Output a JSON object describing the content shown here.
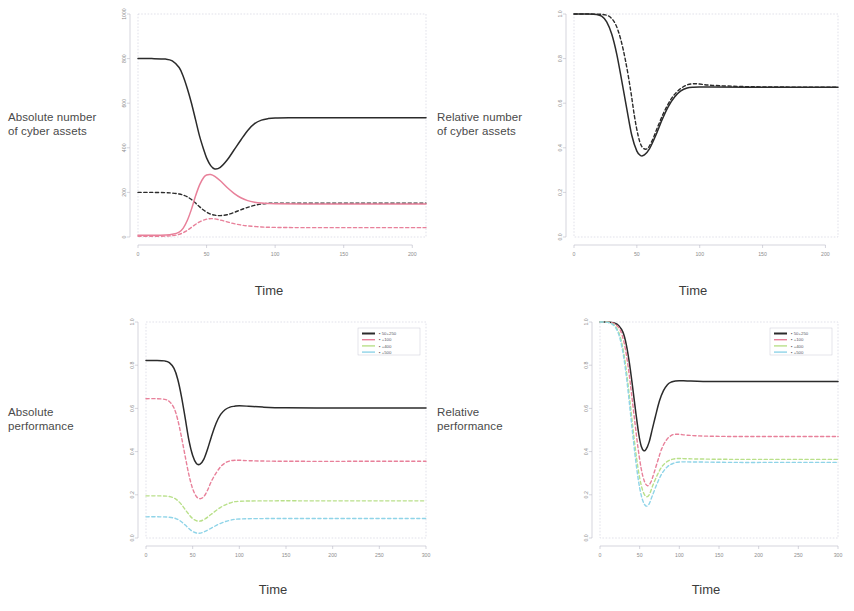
{
  "figure": {
    "row_labels": [
      "Absolute number\nof cyber assets",
      "Relative number\nof cyber assets",
      "Absolute\nperformance",
      "Relative\nperformance"
    ],
    "xlabel": "Time"
  },
  "colors": {
    "black": "#2b2b2b",
    "red": "#e8809a",
    "green": "#b9e08a",
    "cyan": "#8fd4e8",
    "axis": "#b8b8c6",
    "tick_text": "#8d8d8d",
    "label_text": "#4a4a4a"
  },
  "legend": {
    "entries": [
      {
        "label": "50+250",
        "color": "#2b2b2b"
      },
      {
        "label": "+100",
        "color": "#e8809a"
      },
      {
        "label": "+400",
        "color": "#b9e08a"
      },
      {
        "label": "+500",
        "color": "#8fd4e8"
      }
    ]
  },
  "chart_data": [
    {
      "id": "absolute-number",
      "type": "line",
      "title": "Absolute number of cyber assets",
      "xlabel": "Time",
      "ylabel": "",
      "xlim": [
        0,
        210
      ],
      "ylim": [
        0,
        1000
      ],
      "xticks": [
        0,
        50,
        100,
        150,
        200
      ],
      "yticks": [
        0,
        200,
        400,
        600,
        800,
        1000
      ],
      "grid": false,
      "series": [
        {
          "name": "50+250 total",
          "color": "#2b2b2b",
          "style": "solid",
          "x": [
            0,
            10,
            20,
            25,
            30,
            33,
            36,
            39,
            42,
            45,
            48,
            50,
            53,
            56,
            60,
            65,
            70,
            75,
            80,
            85,
            90,
            95,
            100,
            110,
            130,
            160,
            200,
            210
          ],
          "y": [
            800,
            800,
            798,
            790,
            760,
            720,
            665,
            600,
            525,
            450,
            390,
            355,
            320,
            305,
            312,
            345,
            390,
            435,
            478,
            508,
            524,
            531,
            534,
            535,
            535,
            535,
            535,
            535
          ]
        },
        {
          "name": "50+250 susceptible",
          "color": "#2b2b2b",
          "style": "dashed",
          "x": [
            0,
            10,
            20,
            25,
            30,
            33,
            36,
            39,
            42,
            45,
            48,
            52,
            56,
            60,
            65,
            70,
            75,
            80,
            85,
            90,
            95,
            100,
            120,
            160,
            200,
            210
          ],
          "y": [
            200,
            200,
            199,
            197,
            193,
            188,
            180,
            168,
            152,
            135,
            120,
            105,
            98,
            96,
            100,
            110,
            122,
            133,
            142,
            148,
            151,
            152,
            152,
            152,
            152,
            152
          ]
        },
        {
          "name": "+100 infected",
          "color": "#e8809a",
          "style": "solid",
          "x": [
            0,
            10,
            20,
            25,
            30,
            33,
            36,
            39,
            42,
            45,
            48,
            50,
            53,
            56,
            60,
            65,
            70,
            75,
            80,
            85,
            90,
            95,
            100,
            120,
            160,
            200,
            210
          ],
          "y": [
            8,
            8,
            9,
            12,
            22,
            40,
            75,
            125,
            185,
            235,
            268,
            278,
            280,
            272,
            252,
            222,
            196,
            176,
            163,
            156,
            152,
            150,
            149,
            148,
            148,
            148,
            148
          ]
        },
        {
          "name": "+100 recovered",
          "color": "#e8809a",
          "style": "dashed",
          "x": [
            0,
            10,
            20,
            25,
            30,
            35,
            40,
            45,
            50,
            55,
            60,
            65,
            70,
            75,
            80,
            90,
            100,
            120,
            160,
            200,
            210
          ],
          "y": [
            3,
            3,
            4,
            6,
            12,
            26,
            48,
            68,
            80,
            82,
            76,
            68,
            60,
            54,
            50,
            45,
            43,
            42,
            42,
            42,
            42
          ]
        }
      ]
    },
    {
      "id": "relative-number",
      "type": "line",
      "title": "Relative number of cyber assets",
      "xlabel": "Time",
      "ylabel": "",
      "xlim": [
        0,
        210
      ],
      "ylim": [
        0,
        1.0
      ],
      "xticks": [
        0,
        50,
        100,
        150,
        200
      ],
      "yticks": [
        0.0,
        0.2,
        0.4,
        0.6,
        0.8,
        1.0
      ],
      "grid": false,
      "series": [
        {
          "name": "50+250",
          "color": "#2b2b2b",
          "style": "solid",
          "x": [
            0,
            10,
            18,
            22,
            26,
            30,
            34,
            38,
            42,
            46,
            50,
            53,
            56,
            60,
            65,
            70,
            75,
            80,
            85,
            90,
            95,
            100,
            110,
            140,
            180,
            210
          ],
          "y": [
            1.0,
            1.0,
            0.998,
            0.99,
            0.965,
            0.91,
            0.82,
            0.7,
            0.575,
            0.455,
            0.385,
            0.365,
            0.368,
            0.395,
            0.455,
            0.525,
            0.585,
            0.628,
            0.655,
            0.668,
            0.672,
            0.673,
            0.673,
            0.672,
            0.672,
            0.672
          ]
        },
        {
          "name": "+100",
          "color": "#2b2b2b",
          "style": "dashed",
          "x": [
            0,
            10,
            20,
            25,
            29,
            33,
            37,
            41,
            45,
            48,
            51,
            54,
            58,
            62,
            67,
            72,
            78,
            84,
            90,
            95,
            100,
            110,
            140,
            180,
            210
          ],
          "y": [
            1.0,
            1.0,
            0.999,
            0.996,
            0.985,
            0.955,
            0.89,
            0.79,
            0.66,
            0.545,
            0.455,
            0.405,
            0.395,
            0.43,
            0.5,
            0.565,
            0.625,
            0.662,
            0.682,
            0.687,
            0.686,
            0.68,
            0.674,
            0.672,
            0.672
          ]
        }
      ]
    },
    {
      "id": "absolute-performance",
      "type": "line",
      "title": "Absolute performance",
      "xlabel": "Time",
      "ylabel": "",
      "xlim": [
        0,
        300
      ],
      "ylim": [
        0,
        1.0
      ],
      "xticks": [
        0,
        50,
        100,
        150,
        200,
        250,
        300
      ],
      "yticks": [
        0.0,
        0.2,
        0.4,
        0.6,
        0.8,
        1.0
      ],
      "grid": false,
      "legend_position": "top-right",
      "series": [
        {
          "name": "50+250",
          "color": "#2b2b2b",
          "style": "solid",
          "x": [
            0,
            10,
            20,
            25,
            30,
            34,
            38,
            42,
            46,
            50,
            54,
            58,
            62,
            66,
            70,
            75,
            80,
            85,
            90,
            95,
            100,
            110,
            125,
            150,
            200,
            250,
            300
          ],
          "y": [
            0.822,
            0.822,
            0.82,
            0.812,
            0.785,
            0.735,
            0.655,
            0.555,
            0.452,
            0.382,
            0.345,
            0.342,
            0.365,
            0.412,
            0.468,
            0.53,
            0.572,
            0.595,
            0.606,
            0.61,
            0.612,
            0.61,
            0.606,
            0.603,
            0.602,
            0.602,
            0.602
          ]
        },
        {
          "name": "+100",
          "color": "#e8809a",
          "style": "dashed",
          "x": [
            0,
            10,
            20,
            25,
            30,
            34,
            38,
            42,
            46,
            50,
            54,
            58,
            62,
            66,
            70,
            75,
            80,
            85,
            90,
            95,
            100,
            110,
            130,
            170,
            230,
            300
          ],
          "y": [
            0.645,
            0.645,
            0.642,
            0.632,
            0.602,
            0.548,
            0.468,
            0.378,
            0.292,
            0.228,
            0.192,
            0.182,
            0.192,
            0.222,
            0.262,
            0.3,
            0.33,
            0.348,
            0.357,
            0.36,
            0.36,
            0.358,
            0.356,
            0.355,
            0.355,
            0.355
          ]
        },
        {
          "name": "+400",
          "color": "#b9e08a",
          "style": "dashed",
          "x": [
            0,
            15,
            25,
            32,
            38,
            44,
            50,
            56,
            62,
            70,
            80,
            90,
            100,
            130,
            200,
            300
          ],
          "y": [
            0.195,
            0.195,
            0.192,
            0.18,
            0.155,
            0.12,
            0.09,
            0.078,
            0.085,
            0.11,
            0.142,
            0.162,
            0.17,
            0.172,
            0.172,
            0.172
          ]
        },
        {
          "name": "+500",
          "color": "#8fd4e8",
          "style": "dashed",
          "x": [
            0,
            15,
            25,
            32,
            38,
            44,
            50,
            56,
            62,
            70,
            80,
            90,
            100,
            130,
            200,
            300
          ],
          "y": [
            0.098,
            0.098,
            0.096,
            0.09,
            0.075,
            0.052,
            0.03,
            0.022,
            0.028,
            0.046,
            0.068,
            0.082,
            0.088,
            0.09,
            0.09,
            0.09
          ]
        }
      ]
    },
    {
      "id": "relative-performance",
      "type": "line",
      "title": "Relative performance",
      "xlabel": "Time",
      "ylabel": "",
      "xlim": [
        0,
        300
      ],
      "ylim": [
        0,
        1.0
      ],
      "xticks": [
        0,
        50,
        100,
        150,
        200,
        250,
        300
      ],
      "yticks": [
        0.0,
        0.2,
        0.4,
        0.6,
        0.8,
        1.0
      ],
      "grid": false,
      "legend_position": "top-right",
      "series": [
        {
          "name": "50+250",
          "color": "#2b2b2b",
          "style": "solid",
          "x": [
            0,
            10,
            18,
            24,
            29,
            33,
            37,
            41,
            45,
            49,
            52,
            55,
            58,
            62,
            66,
            70,
            75,
            80,
            85,
            90,
            95,
            100,
            110,
            130,
            170,
            230,
            300
          ],
          "y": [
            1.0,
            1.0,
            0.995,
            0.982,
            0.952,
            0.898,
            0.812,
            0.702,
            0.585,
            0.478,
            0.425,
            0.405,
            0.41,
            0.445,
            0.505,
            0.565,
            0.635,
            0.682,
            0.71,
            0.722,
            0.727,
            0.728,
            0.727,
            0.725,
            0.724,
            0.724,
            0.724
          ]
        },
        {
          "name": "+100",
          "color": "#e8809a",
          "style": "dashed",
          "x": [
            0,
            10,
            18,
            24,
            28,
            32,
            36,
            40,
            44,
            48,
            52,
            56,
            60,
            64,
            68,
            73,
            78,
            84,
            90,
            95,
            100,
            110,
            130,
            170,
            230,
            300
          ],
          "y": [
            1.0,
            1.0,
            0.992,
            0.972,
            0.938,
            0.875,
            0.78,
            0.66,
            0.535,
            0.415,
            0.32,
            0.262,
            0.242,
            0.258,
            0.3,
            0.36,
            0.415,
            0.455,
            0.475,
            0.48,
            0.48,
            0.476,
            0.472,
            0.47,
            0.47,
            0.47
          ]
        },
        {
          "name": "+400",
          "color": "#b9e08a",
          "style": "dashed",
          "x": [
            0,
            10,
            17,
            22,
            26,
            30,
            34,
            38,
            42,
            46,
            50,
            54,
            58,
            62,
            66,
            72,
            78,
            85,
            92,
            100,
            120,
            170,
            230,
            300
          ],
          "y": [
            1.0,
            0.999,
            0.988,
            0.965,
            0.925,
            0.855,
            0.752,
            0.625,
            0.492,
            0.372,
            0.278,
            0.218,
            0.192,
            0.2,
            0.238,
            0.29,
            0.33,
            0.355,
            0.365,
            0.368,
            0.366,
            0.364,
            0.364,
            0.364
          ]
        },
        {
          "name": "+500",
          "color": "#8fd4e8",
          "style": "dashed",
          "x": [
            0,
            10,
            17,
            22,
            26,
            30,
            34,
            38,
            42,
            46,
            50,
            54,
            58,
            62,
            66,
            72,
            78,
            85,
            92,
            100,
            120,
            170,
            230,
            300
          ],
          "y": [
            1.0,
            0.998,
            0.985,
            0.958,
            0.912,
            0.835,
            0.725,
            0.592,
            0.455,
            0.33,
            0.232,
            0.172,
            0.148,
            0.158,
            0.196,
            0.252,
            0.298,
            0.33,
            0.345,
            0.352,
            0.352,
            0.35,
            0.35,
            0.35
          ]
        }
      ]
    }
  ]
}
